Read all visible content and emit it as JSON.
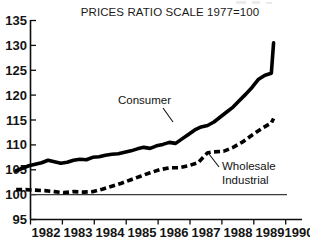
{
  "chart_data": {
    "type": "line",
    "title": "PRICES RATIO SCALE 1977=100",
    "xlabel": "",
    "ylabel": "",
    "xlim": [
      1981.5,
      1990.0
    ],
    "ylim": [
      95,
      135
    ],
    "grid": false,
    "legend_position": "inline-annotations",
    "y_ticks": [
      95,
      100,
      105,
      110,
      115,
      120,
      125,
      130,
      135
    ],
    "x_ticks": [
      1982,
      1983,
      1984,
      1985,
      1986,
      1987,
      1988,
      1989,
      1990
    ],
    "x_tick_labels": [
      "1982",
      "1983",
      "1984",
      "1985",
      "1986",
      "1987",
      "1988",
      "1989",
      "1990"
    ],
    "y_tick_labels": [
      "95",
      "100",
      "105",
      "110",
      "115",
      "120",
      "125",
      "130",
      "135"
    ],
    "reference_line": {
      "value": 100,
      "label": "100"
    },
    "series": [
      {
        "name": "Consumer",
        "style": "solid",
        "x": [
          1981.55,
          1981.75,
          1981.95,
          1982.15,
          1982.35,
          1982.55,
          1982.75,
          1982.95,
          1983.15,
          1983.35,
          1983.55,
          1983.75,
          1983.95,
          1984.15,
          1984.35,
          1984.55,
          1984.75,
          1984.95,
          1985.15,
          1985.35,
          1985.55,
          1985.75,
          1985.95,
          1986.15,
          1986.35,
          1986.55,
          1986.75,
          1986.95,
          1987.15,
          1987.35,
          1987.55,
          1987.75,
          1987.95,
          1988.15,
          1988.35,
          1988.55,
          1988.75,
          1988.95,
          1989.15,
          1989.35,
          1989.55,
          1989.62
        ],
        "values": [
          104.8,
          105.3,
          105.8,
          106.1,
          106.4,
          106.9,
          106.6,
          106.3,
          106.5,
          106.9,
          107.1,
          107.0,
          107.5,
          107.6,
          107.9,
          108.1,
          108.2,
          108.5,
          108.8,
          109.2,
          109.5,
          109.3,
          109.8,
          110.1,
          110.5,
          110.3,
          111.2,
          112.1,
          113.0,
          113.6,
          113.9,
          114.6,
          115.6,
          116.6,
          117.6,
          118.9,
          120.2,
          121.6,
          123.2,
          124.0,
          124.4,
          130.5
        ],
        "start_value": 104.8,
        "end_value": 130.5
      },
      {
        "name": "Wholesale Industrial",
        "style": "dashed",
        "x": [
          1981.55,
          1981.85,
          1982.15,
          1982.45,
          1982.75,
          1983.05,
          1983.35,
          1983.65,
          1983.95,
          1984.25,
          1984.55,
          1984.85,
          1985.15,
          1985.45,
          1985.75,
          1986.05,
          1986.35,
          1986.65,
          1986.95,
          1987.25,
          1987.55,
          1987.75,
          1988.05,
          1988.35,
          1988.65,
          1988.95,
          1989.25,
          1989.55,
          1989.62
        ],
        "values": [
          101.0,
          101.0,
          100.9,
          100.8,
          100.6,
          100.4,
          100.6,
          100.5,
          100.6,
          101.1,
          101.7,
          102.3,
          103.0,
          103.7,
          104.4,
          105.0,
          105.4,
          105.4,
          105.8,
          106.4,
          108.4,
          108.6,
          108.7,
          109.5,
          110.6,
          112.0,
          113.3,
          114.4,
          115.3
        ],
        "start_value": 101.0,
        "end_value": 115.3
      }
    ],
    "annotations": [
      {
        "name": "Consumer",
        "text": "Consumer",
        "lines": [
          "Consumer"
        ]
      },
      {
        "name": "Wholesale Industrial",
        "text": "Wholesale Industrial",
        "lines": [
          "Wholesale",
          "Industrial"
        ]
      }
    ]
  },
  "colors": {
    "background": "#ffffff",
    "ink": "#000000",
    "axis": "#0d0d0d",
    "reference_line": "#3b3b3b"
  }
}
